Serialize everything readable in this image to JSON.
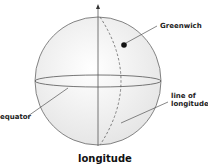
{
  "diagram": {
    "title": "longitude",
    "labels": {
      "greenwich": "Greenwich",
      "line_of_longitude_1": "line of",
      "line_of_longitude_2": "longitude",
      "equator": "equator"
    },
    "colors": {
      "sphere_fill": "#f2f2f2",
      "stroke": "#555555",
      "dot": "#111111"
    }
  }
}
